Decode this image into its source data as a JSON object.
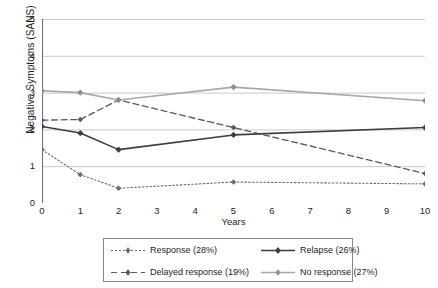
{
  "chart_data": {
    "type": "line",
    "title": "",
    "xlabel": "Years",
    "ylabel": "Negative Symptoms (SANS)",
    "x": [
      0,
      1,
      2,
      5,
      10
    ],
    "xtick_labels": [
      "0",
      "1",
      "2",
      "3",
      "4",
      "5",
      "6",
      "7",
      "8",
      "9",
      "10"
    ],
    "ytick_labels": [
      "0",
      "1",
      "2",
      "3",
      "4",
      "5"
    ],
    "xlim": [
      0,
      10
    ],
    "ylim": [
      0,
      5
    ],
    "grid": "horizontal",
    "legend_position": "bottom",
    "series": [
      {
        "name": "Response (28%)",
        "values": [
          1.45,
          0.77,
          0.4,
          0.57,
          0.52
        ],
        "style": "dotted",
        "color": "#6d6d6d",
        "marker": "diamond"
      },
      {
        "name": "Delayed response (19%)",
        "values": [
          2.25,
          2.27,
          2.8,
          2.05,
          0.8
        ],
        "style": "dashed",
        "color": "#595959",
        "marker": "diamond"
      },
      {
        "name": "Relapse (26%)",
        "values": [
          2.08,
          1.9,
          1.45,
          1.85,
          2.05
        ],
        "style": "solid",
        "color": "#3d3d3d",
        "marker": "diamond"
      },
      {
        "name": "No response (27%)",
        "values": [
          3.05,
          3.0,
          2.8,
          3.15,
          2.78
        ],
        "style": "solid",
        "color": "#a8a8a8",
        "marker": "diamond"
      }
    ]
  },
  "legend": {
    "entries": [
      {
        "label": "Response (28%)"
      },
      {
        "label": "Relapse (26%)"
      },
      {
        "label": "Delayed response (19%)"
      },
      {
        "label": "No response (27%)"
      }
    ]
  },
  "colors": {
    "axis": "#6f6f6f",
    "grid": "#c9c9c9",
    "text": "#231f20",
    "legend_border": "#8a8a8a",
    "background": "#ffffff"
  }
}
